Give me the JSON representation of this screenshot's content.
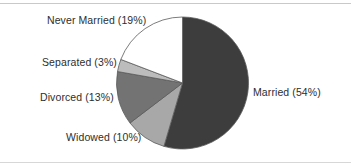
{
  "figure": {
    "background_color": "#ffffff",
    "rule_color": "#c9c9c9"
  },
  "chart_data": {
    "type": "pie",
    "title": "",
    "xlabel": "",
    "ylabel": "",
    "legend_position": "none",
    "grid": false,
    "start_angle_deg": 0,
    "direction": "clockwise",
    "center": {
      "x": 182.5,
      "y": 83
    },
    "radius": 66,
    "categories": [
      "Married",
      "Widowed",
      "Divorced",
      "Separated",
      "Never Married"
    ],
    "values": [
      54,
      10,
      13,
      3,
      19
    ],
    "unit": "%",
    "colors": [
      "#3d3d3d",
      "#a8a8a8",
      "#737373",
      "#bcbcbc",
      "#ffffff"
    ],
    "edge_color": "#5a5a5a",
    "labels": [
      "Married (54%)",
      "Widowed (10%)",
      "Divorced (13%)",
      "Separated (3%)",
      "Never Married (19%)"
    ],
    "slices": [
      {
        "name": "Married",
        "label": "Married (54%)",
        "value": 54,
        "color": "#3d3d3d"
      },
      {
        "name": "Widowed",
        "label": "Widowed (10%)",
        "value": 10,
        "color": "#a8a8a8"
      },
      {
        "name": "Divorced",
        "label": "Divorced (13%)",
        "value": 13,
        "color": "#737373"
      },
      {
        "name": "Separated",
        "label": "Separated (3%)",
        "value": 3,
        "color": "#bcbcbc"
      },
      {
        "name": "Never Married",
        "label": "Never Married (19%)",
        "value": 19,
        "color": "#ffffff"
      }
    ]
  }
}
